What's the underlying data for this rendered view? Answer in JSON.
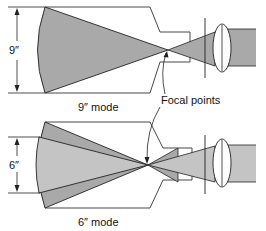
{
  "diagram": {
    "type": "image-intensifier-field-of-view-modes",
    "colors": {
      "outline": "#222222",
      "beam_fill_dark": "#a9a9a9",
      "beam_fill_light": "#c4c4c4",
      "background": "#ffffff"
    },
    "top_panel": {
      "dimension_label": "9″",
      "mode_label": "9″ mode"
    },
    "bottom_panel": {
      "dimension_label": "6″",
      "mode_label": "6″ mode"
    },
    "callout": {
      "label": "Focal points"
    }
  }
}
